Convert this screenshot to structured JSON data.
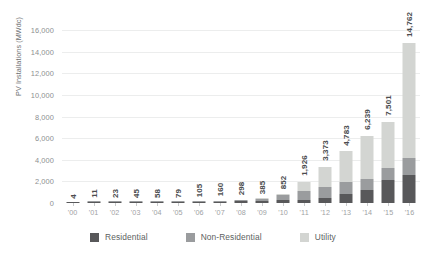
{
  "chart_data": {
    "type": "bar",
    "stacked": true,
    "title": "",
    "xlabel": "",
    "ylabel": "PV Installations (MWdc)",
    "ylim": [
      0,
      16000
    ],
    "ytick_step": 2000,
    "ytick_labels": [
      "16,000",
      "14,000",
      "12,000",
      "10,000",
      "8,000",
      "6,000",
      "4,000",
      "2,000",
      "0"
    ],
    "ytick_values": [
      16000,
      14000,
      12000,
      10000,
      8000,
      6000,
      4000,
      2000,
      0
    ],
    "grid": true,
    "legend_position": "bottom",
    "categories": [
      "'00",
      "'01",
      "'02",
      "'03",
      "'04",
      "'05",
      "'06",
      "'07",
      "'08",
      "'09",
      "'10",
      "'11",
      "'12",
      "'13",
      "'14",
      "'15",
      "'16"
    ],
    "totals": [
      4,
      11,
      23,
      45,
      58,
      79,
      105,
      160,
      298,
      385,
      852,
      1926,
      3373,
      4783,
      6239,
      7501,
      14762
    ],
    "total_labels": [
      "4",
      "11",
      "23",
      "45",
      "58",
      "79",
      "105",
      "160",
      "298",
      "385",
      "852",
      "1,926",
      "3,373",
      "4,783",
      "6,239",
      "7,501",
      "14,762"
    ],
    "series": [
      {
        "name": "Residential",
        "color": "#58585a",
        "values": [
          4,
          9,
          18,
          32,
          40,
          52,
          66,
          94,
          155,
          170,
          280,
          300,
          488,
          792,
          1231,
          2099,
          2583
        ]
      },
      {
        "name": "Non-Residential",
        "color": "#9a9c9e",
        "values": [
          0,
          2,
          5,
          13,
          18,
          27,
          39,
          66,
          143,
          190,
          457,
          800,
          1015,
          1112,
          1021,
          1125,
          1572
        ]
      },
      {
        "name": "Utility",
        "color": "#d3d5d2",
        "values": [
          0,
          0,
          0,
          0,
          0,
          0,
          0,
          0,
          0,
          25,
          115,
          826,
          1870,
          2879,
          3987,
          4277,
          10607
        ]
      }
    ]
  },
  "legend": {
    "items": [
      {
        "label": "Residential",
        "swatch_class": "sw-res",
        "color": "#58585a"
      },
      {
        "label": "Non-Residential",
        "swatch_class": "sw-non",
        "color": "#9a9c9e"
      },
      {
        "label": "Utility",
        "swatch_class": "sw-uti",
        "color": "#d3d5d2"
      }
    ]
  }
}
